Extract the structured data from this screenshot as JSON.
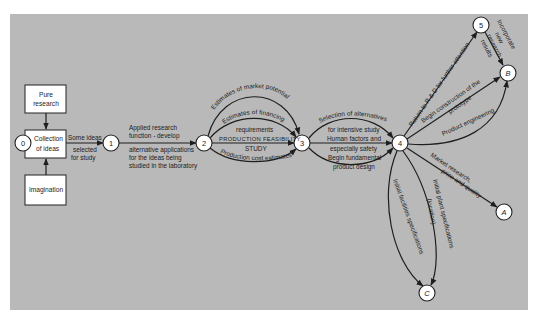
{
  "diagram": {
    "boxes": {
      "pure_research": [
        "Pure",
        "research"
      ],
      "collection": [
        "Collection",
        "of ideas"
      ],
      "imagination": "Imagination"
    },
    "nodes": {
      "n0": "0",
      "n1": "1",
      "n2": "2",
      "n3": "3",
      "n4": "4",
      "n5": "5",
      "a": "A",
      "b": "B",
      "c": "C"
    },
    "labels": {
      "e0_1": [
        "Some ideas",
        "selected",
        "for study"
      ],
      "e1_2_above": [
        "Applied research",
        "function - develop"
      ],
      "e1_2_below": [
        "alternative applications",
        "for the ideas being",
        "studied in the laboratory"
      ],
      "e2_3_market": "Estimates of market potential",
      "e2_3_financing": [
        "Estimates of financing",
        "requirements"
      ],
      "e2_3_feasibility": [
        "PRODUCTION  FEASIBILITY",
        "STUDY"
      ],
      "e2_3_cost": "Production cost estimates",
      "e3_4_top": [
        "Selection of alternatives",
        "for intensive study"
      ],
      "e3_4_mid": [
        "Human factors and",
        "especially safety"
      ],
      "e3_4_bottom": [
        "Begin fundamental",
        "product design"
      ],
      "e4_5": "Return to R & D for further attention",
      "e5_b": [
        "Incorporate",
        "new",
        "research",
        "results"
      ],
      "e4_b_construction": [
        "Begin construction of the",
        "prototype"
      ],
      "e4_b_engineering": "Product engineering",
      "e4_a": [
        "Market research,",
        "price and quality"
      ],
      "e4_c_facilities": "Initial facilities specifications",
      "e4_c_plant": [
        "Initial plant specifications",
        "(location)"
      ]
    }
  },
  "colors": {
    "panel": "#b9b9b9",
    "line": "#1e1e1e",
    "node_fill": "#ffffff"
  }
}
